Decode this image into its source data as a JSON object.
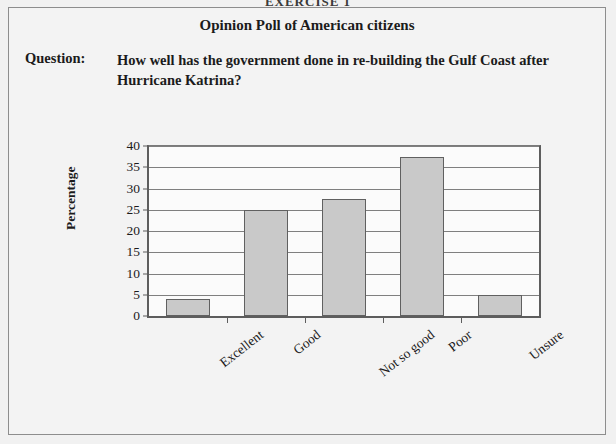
{
  "exercise_header": "EXERCISE 1",
  "poll": {
    "title": "Opinion Poll of American citizens",
    "question_label": "Question:",
    "question_text": "How well has the government done in re-building the Gulf Coast after Hurricane Katrina?"
  },
  "colors": {
    "bar_fill": "#c9c9c9",
    "bar_border": "#606060",
    "axis": "#5d5d5d",
    "gridline": "#7f7f7f",
    "card_background": "#f3f3f3",
    "plot_background": "#fbfbfb",
    "text": "#1b1b1b"
  },
  "chart_data": {
    "type": "bar",
    "title": "",
    "xlabel": "",
    "ylabel": "Percentage",
    "categories": [
      "Excellent",
      "Good",
      "Not so good",
      "Poor",
      "Unsure"
    ],
    "values": [
      4,
      25,
      27.5,
      37.5,
      5
    ],
    "ylim": [
      0,
      40
    ],
    "ytick_labels": [
      "0",
      "5",
      "10",
      "15",
      "20",
      "25",
      "30",
      "35",
      "40"
    ],
    "ytick_values": [
      0,
      5,
      10,
      15,
      20,
      25,
      30,
      35,
      40
    ],
    "grid": true,
    "legend": "none",
    "xtick_rotation": -38
  }
}
